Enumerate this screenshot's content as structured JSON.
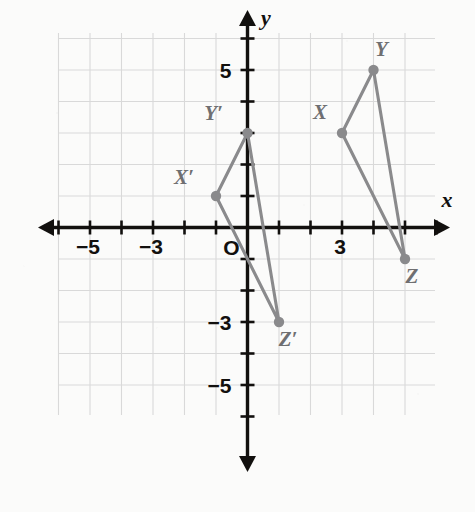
{
  "figure": {
    "kind": "coordinate-plane-geometry-diagram",
    "axis_labels": {
      "x": "x",
      "y": "y"
    },
    "origin_label": "O",
    "x_tick_labels": [
      {
        "value": -5,
        "text": "−5"
      },
      {
        "value": -3,
        "text": "−3"
      },
      {
        "value": 3,
        "text": "3"
      }
    ],
    "y_tick_labels": [
      {
        "value": 5,
        "text": "5"
      },
      {
        "value": -3,
        "text": "−3"
      },
      {
        "value": -5,
        "text": "−5"
      }
    ],
    "axis_range": {
      "xmin": -6,
      "xmax": 6,
      "ymin": -6,
      "ymax": 6
    },
    "grid": "on",
    "grid_color": "#d9d9d9",
    "axis_color": "#12100e",
    "shape_color": "#8a8a8c",
    "point_color": "#8a8a8c"
  },
  "chart_data": {
    "type": "scatter",
    "title": "",
    "xlabel": "x",
    "ylabel": "y",
    "xlim": [
      -6,
      6
    ],
    "ylim": [
      -6,
      6
    ],
    "grid": true,
    "legend": "none",
    "series": [
      {
        "name": "Triangle XYZ",
        "closed": true,
        "points": [
          {
            "label": "X",
            "x": 3,
            "y": 3,
            "label_dx": -22,
            "label_dy": -14
          },
          {
            "label": "Y",
            "x": 4,
            "y": 5,
            "label_dx": 8,
            "label_dy": -14
          },
          {
            "label": "Z",
            "x": 5,
            "y": -1,
            "label_dx": 7,
            "label_dy": 24
          }
        ]
      },
      {
        "name": "Triangle X'Y'Z'",
        "closed": true,
        "points": [
          {
            "label": "X′",
            "x": -1,
            "y": 1,
            "label_dx": -32,
            "label_dy": -12
          },
          {
            "label": "Y′",
            "x": 0,
            "y": 3,
            "label_dx": -34,
            "label_dy": -13
          },
          {
            "label": "Z′",
            "x": 1,
            "y": -3,
            "label_dx": 9,
            "label_dy": 24
          }
        ]
      }
    ]
  }
}
